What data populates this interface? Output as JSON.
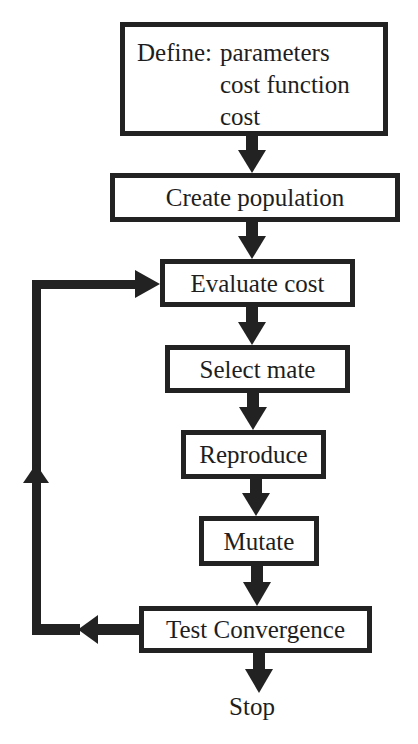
{
  "diagram": {
    "type": "flowchart",
    "colors": {
      "stroke": "#222222",
      "background": "#ffffff",
      "text": "#1e1e1e"
    },
    "define_box": {
      "label": "Define:",
      "items": [
        "parameters",
        "cost function",
        "cost"
      ]
    },
    "steps": [
      {
        "id": "create-population",
        "label": "Create population"
      },
      {
        "id": "evaluate-cost",
        "label": "Evaluate cost"
      },
      {
        "id": "select-mate",
        "label": "Select mate"
      },
      {
        "id": "reproduce",
        "label": "Reproduce"
      },
      {
        "id": "mutate",
        "label": "Mutate"
      },
      {
        "id": "test-convergence",
        "label": "Test Convergence"
      }
    ],
    "terminal": {
      "label": "Stop"
    },
    "edges": [
      {
        "from": "define",
        "to": "create-population"
      },
      {
        "from": "create-population",
        "to": "evaluate-cost"
      },
      {
        "from": "evaluate-cost",
        "to": "select-mate"
      },
      {
        "from": "select-mate",
        "to": "reproduce"
      },
      {
        "from": "reproduce",
        "to": "mutate"
      },
      {
        "from": "mutate",
        "to": "test-convergence"
      },
      {
        "from": "test-convergence",
        "to": "stop"
      },
      {
        "from": "test-convergence",
        "to": "evaluate-cost",
        "kind": "loop-back"
      }
    ]
  }
}
